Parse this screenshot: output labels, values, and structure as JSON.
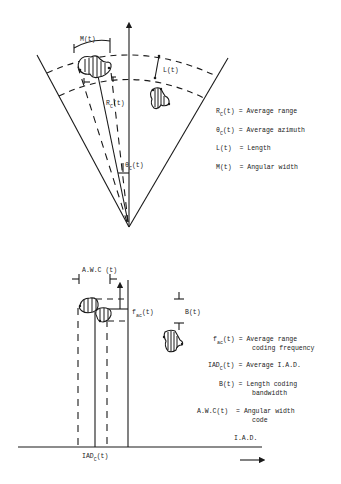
{
  "top_diagram": {
    "labels": {
      "M": "M(t)",
      "L": "L(t)",
      "Rc_main": "R",
      "Rc_sub": "C",
      "Rc_tail": "(t)",
      "theta_main": "θ",
      "theta_sub": "C",
      "theta_tail": "(t)"
    },
    "legend": [
      {
        "symbol": "R",
        "sub": "C",
        "tail": "(t)",
        "definition": "= Average range"
      },
      {
        "symbol": "θ",
        "sub": "C",
        "tail": "(t)",
        "definition": "= Average azimuth"
      },
      {
        "symbol": "L(t)",
        "sub": "",
        "tail": "",
        "definition": " = Length"
      },
      {
        "symbol": "M(t)",
        "sub": "",
        "tail": "",
        "definition": " = Angular width"
      }
    ]
  },
  "bottom_diagram": {
    "labels": {
      "awc": "A.W.C (t)",
      "fac_main": "f",
      "fac_sub": "ac",
      "fac_tail": "(t)",
      "B": "B(t)",
      "iad_main": "IAD",
      "iad_sub": "C",
      "iad_tail": "(t)",
      "axis": "I.A.D."
    },
    "legend": [
      {
        "symbol": "f",
        "sub": "ac",
        "tail": "(t)",
        "line1": "= Average range",
        "line2": "coding frequency"
      },
      {
        "symbol": "IAD",
        "sub": "C",
        "tail": "(t)",
        "line1": "= Average I.A.D.",
        "line2": ""
      },
      {
        "symbol": "B(t)",
        "sub": "",
        "tail": "",
        "line1": "= Length coding",
        "line2": "bandwidth"
      },
      {
        "symbol": "A.W.C(t)",
        "sub": "",
        "tail": "",
        "line1": " = Angular width",
        "line2": "code"
      }
    ]
  }
}
